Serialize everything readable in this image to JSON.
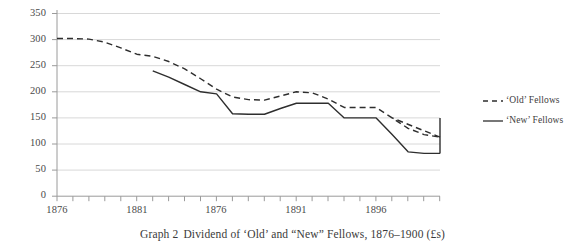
{
  "caption": {
    "prefix": "Graph 2",
    "text": "Dividend of ‘Old’ and “New” Fellows, 1876–1900 (£s)"
  },
  "legend": {
    "position": "right",
    "entries": [
      {
        "label": "‘Old’ Fellows",
        "style": "dashed",
        "color": "#2e2e2e"
      },
      {
        "label": "‘New’ Fellows",
        "style": "solid",
        "color": "#2e2e2e"
      }
    ]
  },
  "axes": {
    "y_ticks": [
      "0",
      "50",
      "100",
      "150",
      "200",
      "250",
      "300",
      "350"
    ],
    "x_ticks": [
      "1876",
      "1881",
      "1876",
      "1891",
      "1896"
    ]
  },
  "colors": {
    "grid": "#d8d8d8",
    "axis": "#9a9a9a",
    "line": "#2e2e2e",
    "text": "#3a3a3a",
    "background": "#ffffff"
  },
  "chart_data": {
    "type": "line",
    "title": "Dividend of ‘Old’ and “New” Fellows, 1876–1900 (£s)",
    "xlabel": "",
    "ylabel": "",
    "xlim": [
      1876,
      1900
    ],
    "ylim": [
      0,
      350
    ],
    "grid": true,
    "legend_position": "right",
    "x": [
      1876,
      1877,
      1878,
      1879,
      1880,
      1881,
      1882,
      1883,
      1884,
      1885,
      1886,
      1887,
      1888,
      1889,
      1890,
      1891,
      1892,
      1893,
      1894,
      1895,
      1896,
      1897,
      1898,
      1899,
      1900
    ],
    "series": [
      {
        "name": "‘Old’ Fellows",
        "style": "dashed",
        "values": [
          302,
          302,
          301,
          295,
          284,
          272,
          268,
          258,
          244,
          225,
          205,
          190,
          185,
          184,
          192,
          200,
          198,
          186,
          170,
          170,
          170,
          150,
          130,
          118,
          113
        ]
      },
      {
        "name": "‘New’ Fellows",
        "style": "solid",
        "values": [
          null,
          null,
          null,
          null,
          null,
          null,
          240,
          228,
          214,
          200,
          196,
          158,
          157,
          157,
          168,
          178,
          178,
          178,
          150,
          150,
          150,
          118,
          85,
          82,
          82
        ]
      }
    ]
  }
}
